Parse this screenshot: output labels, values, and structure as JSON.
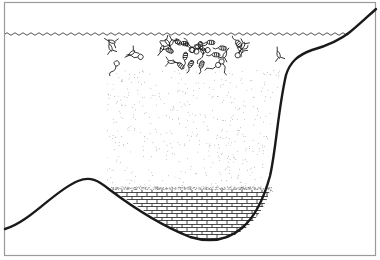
{
  "diagram": {
    "title": "Lake cross-section with plankton, water column, and sediment",
    "regions": [
      {
        "id": "water-surface",
        "label": "Water surface"
      },
      {
        "id": "plankton-layer",
        "label": "Plankton near surface"
      },
      {
        "id": "water-column",
        "label": "Water column with suspended particles"
      },
      {
        "id": "sediment-layer",
        "label": "Fine sediment"
      },
      {
        "id": "bedrock-deposit",
        "label": "Accumulated deposit (brick pattern)"
      },
      {
        "id": "lake-basin",
        "label": "Lake basin outline"
      }
    ],
    "colors": {
      "line": "#1a1a1a",
      "frame": "#9a9a9a",
      "stipple": "#8a8a8a",
      "background": "#ffffff"
    }
  }
}
